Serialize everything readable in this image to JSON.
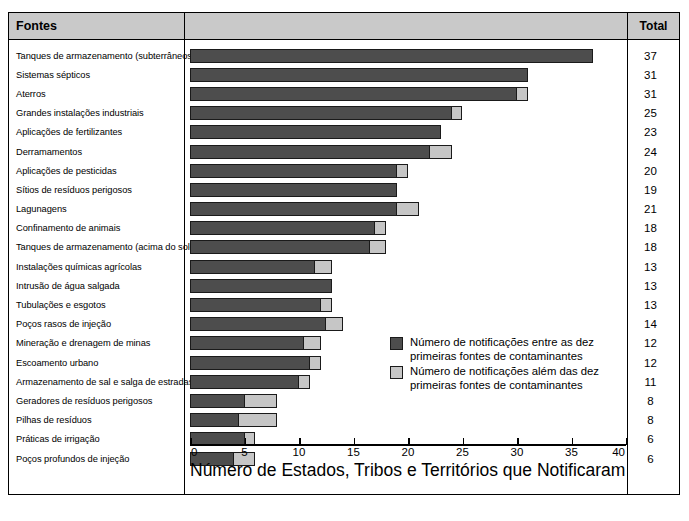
{
  "table": {
    "header": {
      "sources_label": "Fontes",
      "total_label": "Total"
    }
  },
  "legend": {
    "items": [
      {
        "swatch": "dark",
        "color": "#4d4d4d",
        "label": "Número de notificações entre as dez primeiras fontes de contaminantes"
      },
      {
        "swatch": "light",
        "color": "#c6c6c6",
        "label": "Número de notificações além das dez primeiras fontes de contaminantes"
      }
    ]
  },
  "chart_data": {
    "type": "bar",
    "orientation": "horizontal",
    "stacked": true,
    "title": "",
    "xlabel": "Número de Estados, Tribos e Territórios que Notificaram",
    "ylabel": "Fontes",
    "xlim": [
      0,
      40
    ],
    "xticks": [
      0,
      5,
      10,
      15,
      20,
      25,
      30,
      35,
      40
    ],
    "grid": false,
    "legend_position": "inside-right",
    "categories": [
      "Tanques de armazenamento (subterrâneos)",
      "Sistemas sépticos",
      "Aterros",
      "Grandes instalações industriais",
      "Aplicações de fertilizantes",
      "Derramamentos",
      "Aplicações de pesticidas",
      "Sítios de resíduos perigosos",
      "Lagunagens",
      "Confinamento de animais",
      "Tanques de armazenamento (acima do solo)",
      "Instalações químicas agrícolas",
      "Intrusão de água salgada",
      "Tubulações e esgotos",
      "Poços rasos de injeção",
      "Mineração e drenagem de minas",
      "Escoamento urbano",
      "Armazenamento de sal e salga de estradas",
      "Geradores de resíduos perigosos",
      "Pilhas de resíduos",
      "Práticas de irrigação",
      "Poços profundos de injeção"
    ],
    "series": [
      {
        "name": "Número de notificações entre as dez primeiras fontes de contaminantes",
        "color": "#4d4d4d",
        "values": [
          37,
          31,
          30,
          24,
          23,
          22,
          19,
          19,
          19,
          17,
          16.5,
          11.5,
          13,
          12,
          12.5,
          10.5,
          11,
          10,
          5,
          4.5,
          5,
          4
        ]
      },
      {
        "name": "Número de notificações além das dez primeiras fontes de contaminantes",
        "color": "#c6c6c6",
        "values": [
          0,
          0,
          1,
          1,
          0,
          2,
          1,
          0,
          2,
          1,
          1.5,
          1.5,
          0,
          1,
          1.5,
          1.5,
          1,
          1,
          3,
          3.5,
          1,
          2
        ]
      }
    ],
    "totals": [
      37,
      31,
      31,
      25,
      23,
      24,
      20,
      19,
      21,
      18,
      18,
      13,
      13,
      13,
      14,
      12,
      12,
      11,
      8,
      8,
      6,
      6
    ]
  }
}
